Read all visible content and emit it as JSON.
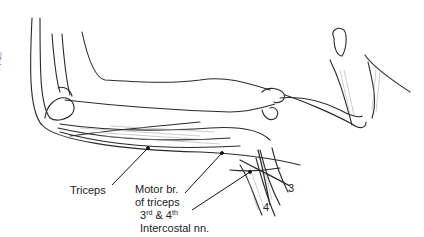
{
  "figure": {
    "signature": "©Baker",
    "labels": {
      "triceps": "Triceps",
      "motor_line1": "Motor br.",
      "motor_line2": "of triceps",
      "intercostal_base3": "3",
      "intercostal_sup3": "rd",
      "intercostal_amp": " & 4",
      "intercostal_sup4": "th",
      "intercostal_line2": "Intercostal nn.",
      "num3": "3",
      "num4": "4"
    },
    "colors": {
      "ink": "#2a2a2a",
      "shade": "#9a9a9a",
      "background": "#ffffff"
    }
  }
}
